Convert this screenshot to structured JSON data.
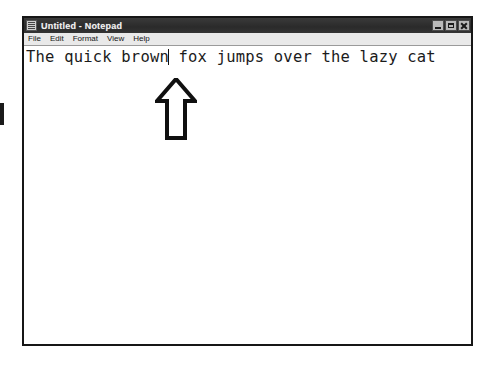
{
  "window": {
    "title": "Untitled - Notepad",
    "icon": "notepad-document-icon",
    "controls": [
      {
        "name": "minimize",
        "label": "_"
      },
      {
        "name": "maximize",
        "label": "□"
      },
      {
        "name": "close",
        "label": "✕"
      }
    ]
  },
  "menubar": {
    "items": [
      {
        "label": "File"
      },
      {
        "label": "Edit"
      },
      {
        "label": "Format"
      },
      {
        "label": "View"
      },
      {
        "label": "Help"
      }
    ]
  },
  "editor": {
    "text_before_caret": "The quick brown",
    "text_after_caret": " fox jumps over the lazy cat",
    "full_text": "The quick brown fox jumps over the lazy cat",
    "caret_visible": true
  },
  "annotation": {
    "arrow": "up-arrow",
    "points_at": "text-caret"
  },
  "colors": {
    "titlebar": "#2f2f2f",
    "titlebar_text": "#f2f2f2",
    "menubar": "#e9e9e9",
    "window_border": "#161616",
    "editor_background": "#ffffff",
    "editor_text": "#1b1b1b",
    "annotation_outline": "#101010"
  }
}
